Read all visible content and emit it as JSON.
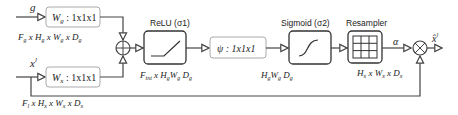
{
  "inputs": {
    "g": {
      "label": "g",
      "conv": "W_g : 1x1x1",
      "dims": "F_g x H_g x W_g x D_g"
    },
    "x": {
      "label": "x^l",
      "conv": "W_x : 1x1x1",
      "dims": "F_l x H_x x W_x x D_x"
    }
  },
  "blocks": {
    "relu": {
      "title": "ReLU (σ1)",
      "dims": "F_int x H_g W_g D_g"
    },
    "psi": {
      "conv": "ψ : 1x1x1",
      "dims": "H_g W_g D_g"
    },
    "sigmoid": {
      "title": "Sigmoid (σ2)"
    },
    "resampler": {
      "title": "Resampler",
      "dims": "H_x x W_x x D_x"
    }
  },
  "labels": {
    "alpha": "α",
    "output": "x̂^l"
  },
  "colors": {
    "line": "#444444",
    "box_border": "#999999",
    "block_border": "#333333"
  }
}
